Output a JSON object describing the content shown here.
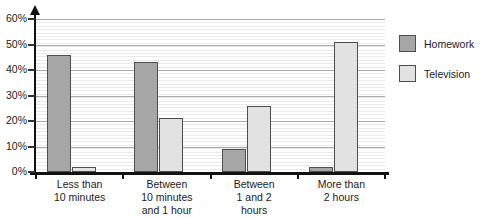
{
  "chart_data": {
    "type": "bar",
    "title": "",
    "xlabel": "",
    "ylabel": "",
    "ylim": [
      0,
      60
    ],
    "y_ticks": [
      "0%",
      "10%",
      "20%",
      "30%",
      "40%",
      "50%",
      "60%"
    ],
    "y_tick_values": [
      0,
      10,
      20,
      30,
      40,
      50,
      60
    ],
    "grid": true,
    "minor_grid": true,
    "legend_position": "right",
    "categories": [
      "Less than\n10 minutes",
      "Between\n10 minutes\nand 1 hour",
      "Between\n1 and 2\nhours",
      "More than\n2 hours"
    ],
    "category_lines": [
      [
        "Less than",
        "10 minutes"
      ],
      [
        "Between",
        "10 minutes",
        "and 1 hour"
      ],
      [
        "Between",
        "1 and 2",
        "hours"
      ],
      [
        "More than",
        "2 hours"
      ]
    ],
    "series": [
      {
        "name": "Homework",
        "color": "#a6a6a6",
        "values": [
          46,
          43,
          9,
          2
        ]
      },
      {
        "name": "Television",
        "color": "#e2e2e2",
        "values": [
          2,
          21,
          26,
          51
        ]
      }
    ]
  },
  "legend": {
    "items": [
      {
        "label": "Homework",
        "color": "#a6a6a6"
      },
      {
        "label": "Television",
        "color": "#e2e2e2"
      }
    ]
  },
  "colors": {
    "homework": "#a6a6a6",
    "television": "#e2e2e2",
    "bar_outline": "#4d4d4d",
    "axis": "#111111",
    "major_gridline": "#a9a9a9",
    "minor_gridline": "#e9e9e9",
    "text": "#1a1a1a",
    "background": "#ffffff"
  }
}
